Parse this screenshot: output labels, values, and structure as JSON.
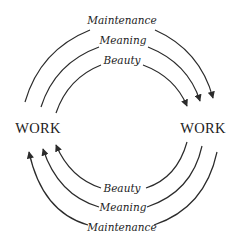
{
  "diagram": {
    "nodes": {
      "left": "WORK",
      "right": "WORK"
    },
    "top_arcs": [
      {
        "label": "Maintenance",
        "direction": "left-to-right"
      },
      {
        "label": "Meaning",
        "direction": "left-to-right"
      },
      {
        "label": "Beauty",
        "direction": "left-to-right"
      }
    ],
    "bottom_arcs": [
      {
        "label": "Beauty",
        "direction": "right-to-left"
      },
      {
        "label": "Meaning",
        "direction": "right-to-left"
      },
      {
        "label": "Maintenance",
        "direction": "right-to-left"
      }
    ],
    "colors": {
      "stroke": "#2b2b2b",
      "text": "#222222",
      "background": "#ffffff"
    }
  }
}
